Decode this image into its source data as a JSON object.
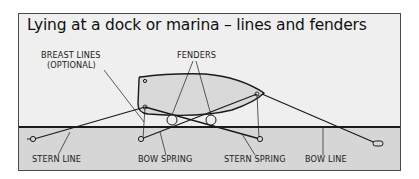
{
  "title": "Lying at a dock or marina – lines and fenders",
  "labels": {
    "breast_lines": "BREAST LINES",
    "breast_lines_note": "(OPTIONAL)",
    "fenders": "FENDERS",
    "stern_line": "STERN LINE",
    "bow_spring": "BOW SPRING",
    "stern_spring": "STERN SPRING",
    "bow_line": "BOW LINE"
  },
  "colors": {
    "background": "#efefef",
    "dock": "#d6d6d6",
    "hull_fill": "#d9d9d9",
    "line": "#1a1a1a",
    "frame_border": "#4a4a4a"
  }
}
